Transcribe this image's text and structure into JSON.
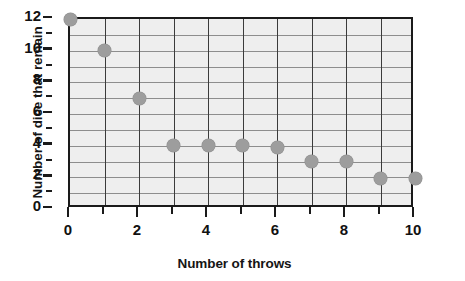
{
  "chart_data": {
    "type": "scatter",
    "title": "",
    "xlabel": "Number of throws",
    "ylabel": "Number of dice that remain",
    "x": [
      0,
      1,
      2,
      3,
      4,
      5,
      6,
      7,
      8,
      9,
      10
    ],
    "values": [
      12,
      10,
      7,
      4,
      4,
      4,
      3.9,
      3,
      3,
      1.9,
      1.9
    ],
    "xlim": [
      0,
      10
    ],
    "ylim": [
      0,
      12
    ],
    "xticks": [
      0,
      1,
      2,
      3,
      4,
      5,
      6,
      7,
      8,
      9,
      10
    ],
    "xtick_labels": [
      "0",
      "",
      "2",
      "",
      "4",
      "",
      "6",
      "",
      "8",
      "",
      "10"
    ],
    "yticks": [
      0,
      1,
      2,
      3,
      4,
      5,
      6,
      7,
      8,
      9,
      10,
      11,
      12
    ],
    "ytick_labels": [
      "0",
      "",
      "2",
      "",
      "4",
      "",
      "6",
      "",
      "8",
      "",
      "10",
      "",
      "12"
    ],
    "grid": true,
    "legend": "none",
    "marker_color": "#9d9d9d",
    "plot_background": "#eeeeee",
    "axis_color": "#1a1a1a"
  }
}
